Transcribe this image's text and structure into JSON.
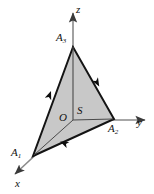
{
  "figure": {
    "type": "3d-coordinate-diagram",
    "background_color": "#ffffff",
    "surface_fill_color": "#c8c8c8",
    "edge_color": "#141414",
    "axis_color": "#6e6e6e",
    "label_color": "#111111"
  },
  "axes": [
    {
      "name": "x-axis",
      "label": "x",
      "label_x": 15,
      "label_y": 180,
      "from": [
        73,
        120
      ],
      "to": [
        13,
        176
      ],
      "arrow": true
    },
    {
      "name": "y-axis",
      "label": "y",
      "label_x": 137,
      "label_y": 119,
      "from": [
        73,
        120
      ],
      "to": [
        146,
        120
      ],
      "arrow": true
    },
    {
      "name": "z-axis",
      "label": "z",
      "label_x": 76,
      "label_y": 5,
      "from": [
        73,
        120
      ],
      "to": [
        73,
        12
      ],
      "arrow": true
    }
  ],
  "vertices": [
    {
      "name": "A1",
      "label_main": "A",
      "label_sub": "1",
      "point_x": 33,
      "point_y": 156,
      "label_x": 12,
      "label_y": 148
    },
    {
      "name": "A2",
      "label_main": "A",
      "label_sub": "2",
      "point_x": 114,
      "point_y": 119,
      "label_x": 109,
      "label_y": 124
    },
    {
      "name": "A3",
      "label_main": "A",
      "label_sub": "3",
      "point_x": 73,
      "point_y": 47,
      "label_x": 56,
      "label_y": 33
    }
  ],
  "points": [
    {
      "name": "origin",
      "label": "O",
      "label_x": 59,
      "label_y": 114,
      "point_x": 73,
      "point_y": 120
    },
    {
      "name": "surface",
      "label": "S",
      "label_x": 77,
      "label_y": 107,
      "point_x": 82,
      "point_y": 112
    }
  ],
  "edge_arrows": [
    {
      "name": "arrow-A1-A3",
      "x": 48,
      "y": 99,
      "angle": -56
    },
    {
      "name": "arrow-A3-A2",
      "x": 96,
      "y": 79,
      "angle": 60
    },
    {
      "name": "arrow-A2-A1",
      "x": 68,
      "y": 145,
      "angle": 204
    }
  ],
  "interior_lines": [
    {
      "name": "line-O-A3",
      "from": [
        73,
        120
      ],
      "to": [
        73,
        47
      ]
    },
    {
      "name": "line-O-A1",
      "from": [
        73,
        120
      ],
      "to": [
        33,
        156
      ]
    },
    {
      "name": "line-O-A2",
      "from": [
        73,
        120
      ],
      "to": [
        114,
        119
      ]
    }
  ],
  "triangle": {
    "name": "surface-triangle",
    "points": "33,156 73,47 114,119"
  }
}
